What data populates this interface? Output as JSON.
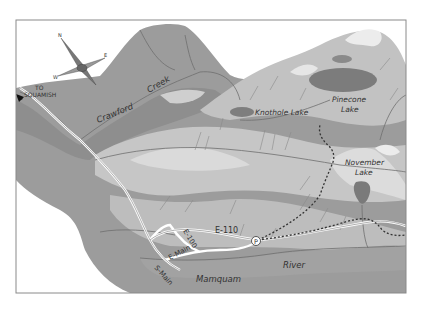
{
  "map": {
    "title": "Mamquam River area map",
    "colors": {
      "paper": "#ffffff",
      "border": "#8a8a8a",
      "valley": "#9a9a9a",
      "valley_dark": "#8c8c8c",
      "terrain": "#bcbcbc",
      "terrain_light": "#d2d2d2",
      "snow": "#e8e8e8",
      "lake": "#7a7a7a",
      "creek": "#6e6e6e",
      "road": "#ffffff",
      "trail": "#333333"
    },
    "compass": {
      "north": "N",
      "east": "E",
      "west": "W",
      "south": "S"
    },
    "labels": {
      "to_squamish_line1": "TO",
      "to_squamish_line2": "SQUAMISH",
      "crawford": "Crawford",
      "creek": "Creek",
      "knothole_lake": "Knothole Lake",
      "pinecone_line1": "Pinecone",
      "pinecone_line2": "Lake",
      "november_line1": "November",
      "november_line2": "Lake",
      "e110": "E-110",
      "e100": "E-100",
      "e_main": "E-Main",
      "s_main": "S-Main",
      "mamquam": "Mamquam",
      "river": "River",
      "parking": "P"
    }
  }
}
